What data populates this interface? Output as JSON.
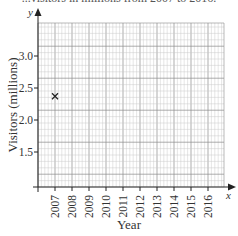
{
  "header": {
    "title_fragment": "...visitors in millions from 2007 to 2016."
  },
  "chart_data": {
    "type": "scatter",
    "title": "",
    "xlabel": "Year",
    "ylabel": "Visitors (millions)",
    "x_axis_variable": "x",
    "y_axis_variable": "y",
    "categories": [
      "2007",
      "2008",
      "2009",
      "2010",
      "2011",
      "2012",
      "2013",
      "2014",
      "2015",
      "2016"
    ],
    "y_ticks": [
      "1.5",
      "2.0",
      "2.5",
      "3.0"
    ],
    "ylim": [
      1.0,
      3.5
    ],
    "grid": true,
    "axis_break": "y-axis starts above 0 (origin not at 0)",
    "series": [
      {
        "name": "Visitors",
        "marker": "x",
        "points": [
          {
            "x": "2007",
            "y": 2.37
          }
        ]
      }
    ],
    "colors": {
      "grid_minor": "#c8c8c8",
      "grid_major": "#8a8a8a",
      "axis": "#222222",
      "marker": "#222222"
    }
  }
}
